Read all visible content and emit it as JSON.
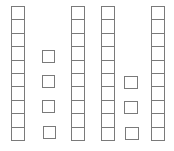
{
  "diagram": {
    "type": "base-ten-blocks",
    "stroke_color": "#7a7a7a",
    "background": "#ffffff",
    "groups": [
      {
        "kind": "ten-rod",
        "cells": 10
      },
      {
        "kind": "units",
        "count": 4
      },
      {
        "kind": "ten-rod",
        "cells": 10
      },
      {
        "kind": "ten-rod",
        "cells": 10
      },
      {
        "kind": "units",
        "count": 3
      },
      {
        "kind": "ten-rod",
        "cells": 10
      }
    ],
    "summary": {
      "tens": 4,
      "ones": 7,
      "value": 47
    }
  }
}
